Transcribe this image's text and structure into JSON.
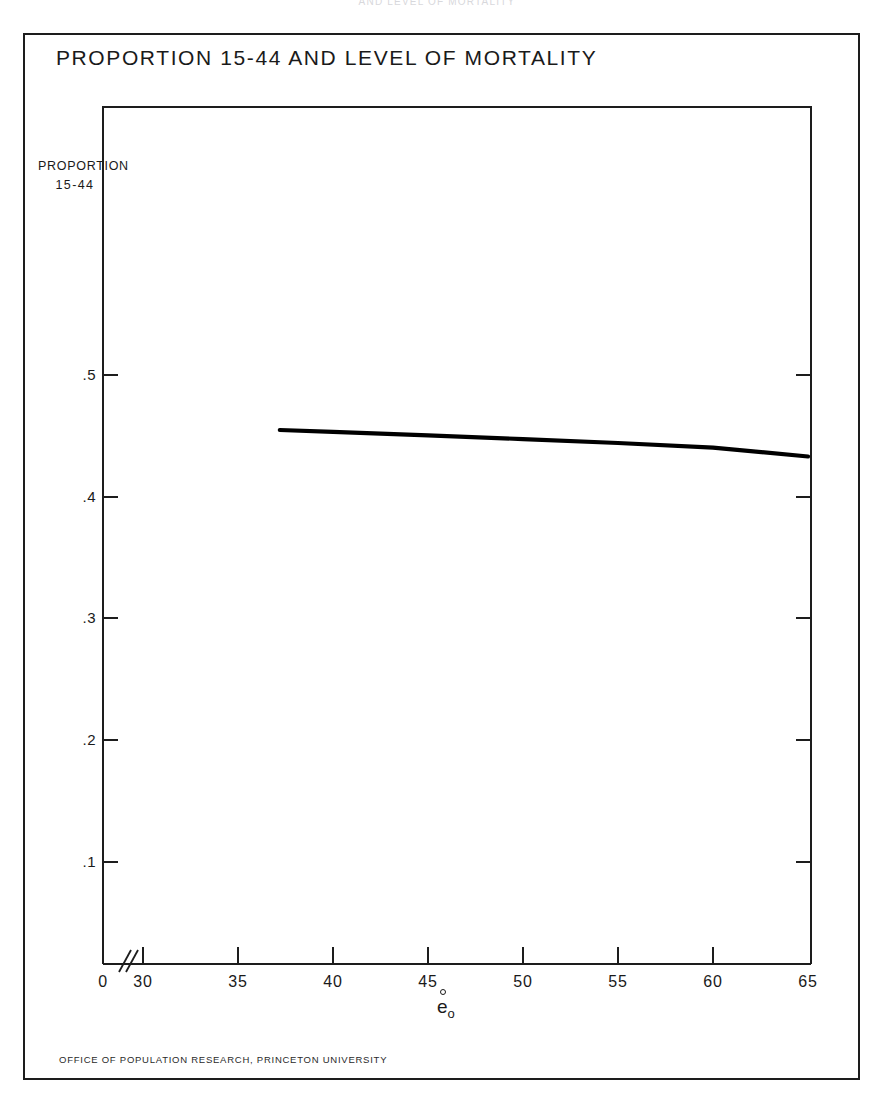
{
  "running_head": "AND LEVEL OF MORTALITY",
  "figure": {
    "title": "PROPORTION 15-44 AND LEVEL OF MORTALITY",
    "credit": "OFFICE OF POPULATION RESEARCH,  PRINCETON  UNIVERSITY",
    "y_caption_line1": "PROPORTION",
    "y_caption_line2": "15-44",
    "x_caption_base": "e",
    "x_caption_sub": "o"
  },
  "chart_data": {
    "type": "line",
    "title": "PROPORTION 15-44 AND LEVEL OF MORTALITY",
    "xlabel": "e̊₀",
    "ylabel": "PROPORTION 15-44",
    "xlim": [
      30,
      65
    ],
    "ylim": [
      0,
      0.55
    ],
    "grid": false,
    "legend": "none",
    "axis_break": {
      "present": true,
      "between": [
        0,
        30
      ],
      "symbol": "//"
    },
    "x_ticks": [
      0,
      30,
      35,
      40,
      45,
      50,
      55,
      60,
      65
    ],
    "x_tick_labels": [
      "0",
      "30",
      "35",
      "40",
      "45",
      "50",
      "55",
      "60",
      "65"
    ],
    "y_ticks": [
      0.1,
      0.2,
      0.3,
      0.4,
      0.5
    ],
    "y_tick_labels": [
      ".1",
      ".2",
      ".3",
      ".4",
      ".5"
    ],
    "series": [
      {
        "name": "Proportion aged 15-44",
        "color": "#000000",
        "x": [
          37.2,
          40,
          45,
          50,
          55,
          60,
          65
        ],
        "values": [
          0.455,
          0.4535,
          0.4505,
          0.4475,
          0.4443,
          0.4405,
          0.4332
        ]
      }
    ]
  }
}
